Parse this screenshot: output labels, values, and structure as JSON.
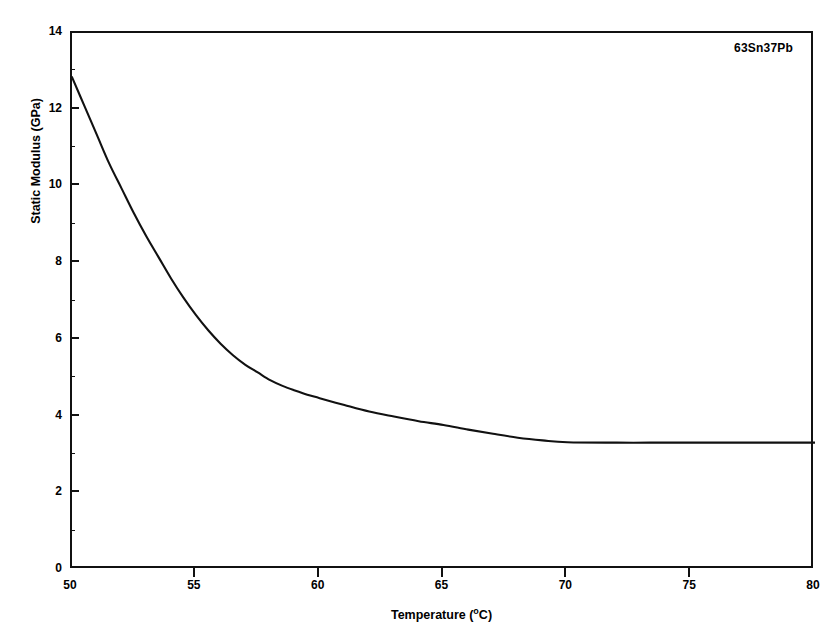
{
  "chart_data": {
    "type": "line",
    "title": "",
    "subtitle": "",
    "xlabel": "Temperature (°C)",
    "ylabel": "Static Modulus (GPa)",
    "xlim": [
      50,
      80
    ],
    "ylim": [
      0,
      14
    ],
    "xticks": [
      50,
      55,
      60,
      65,
      70,
      75,
      80
    ],
    "yticks": [
      0,
      2,
      4,
      6,
      8,
      10,
      12,
      14
    ],
    "grid": false,
    "legend_position": "none",
    "annotations": [
      {
        "text": "63Sn37Pb",
        "position": "top-right-inside-axes"
      }
    ],
    "series": [
      {
        "name": "63Sn37Pb",
        "color": "#111111",
        "x": [
          50.0,
          50.5,
          51.0,
          51.5,
          52.0,
          52.5,
          53.0,
          53.5,
          54.0,
          54.5,
          55.0,
          55.5,
          56.0,
          56.5,
          57.0,
          57.5,
          58.0,
          58.5,
          59.0,
          59.5,
          60.0,
          61.0,
          62.0,
          63.0,
          64.0,
          65.0,
          66.0,
          67.0,
          68.0,
          69.0,
          70.0,
          72.0,
          74.0,
          76.0,
          78.0,
          80.0
        ],
        "values": [
          12.85,
          12.1,
          11.35,
          10.6,
          9.95,
          9.3,
          8.7,
          8.15,
          7.6,
          7.1,
          6.65,
          6.25,
          5.9,
          5.6,
          5.35,
          5.15,
          4.95,
          4.8,
          4.68,
          4.57,
          4.48,
          4.3,
          4.13,
          4.0,
          3.88,
          3.78,
          3.66,
          3.55,
          3.45,
          3.38,
          3.33,
          3.32,
          3.32,
          3.32,
          3.32,
          3.32
        ]
      }
    ]
  },
  "axes": {
    "y_tick_labels": [
      "0",
      "2",
      "4",
      "6",
      "8",
      "10",
      "12",
      "14"
    ],
    "x_tick_labels": [
      "50",
      "55",
      "60",
      "65",
      "70",
      "75",
      "80"
    ],
    "y_title": "Static Modulus (GPa)",
    "x_title_main": "Temperature (",
    "x_title_degree": "o",
    "x_title_tail": "C)"
  },
  "annotation": {
    "label": "63Sn37Pb"
  },
  "colors": {
    "curve": "#111111",
    "axis": "#111111",
    "background": "#ffffff"
  }
}
